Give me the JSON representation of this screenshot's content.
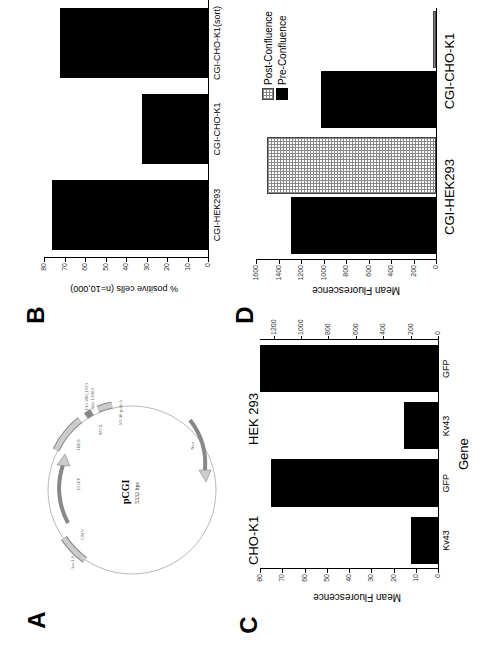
{
  "panels": {
    "A": {
      "label": "A",
      "plasmid_name": "pCGI",
      "plasmid_size": "5332 bps",
      "features": [
        "CMV",
        "EGFP",
        "IRES",
        "MCS",
        "SV40 polyA",
        "Neo",
        "Ase I,6",
        "Pfo 480,1923",
        "Xba 12003"
      ]
    },
    "B": {
      "label": "B"
    },
    "C": {
      "label": "C"
    },
    "D": {
      "label": "D"
    }
  },
  "chart_data": [
    {
      "panel": "B",
      "type": "bar",
      "categories": [
        "CGI-HEK293",
        "CGI-CHO-K1",
        "CGI-CHO-K1(sort)"
      ],
      "values": [
        76,
        32,
        72
      ],
      "title": "",
      "xlabel": "",
      "ylabel": "% positive cells (n=10,000)",
      "ylim": [
        0,
        80
      ],
      "yticks": [
        "0",
        "10",
        "20",
        "30",
        "40",
        "50",
        "60",
        "70",
        "80"
      ],
      "grid": false
    },
    {
      "panel": "C",
      "type": "bar",
      "groups": [
        {
          "name": "CHO-K1",
          "categories": [
            "Kv43",
            "GFP"
          ],
          "values": [
            12,
            75
          ],
          "ylim": [
            0,
            80
          ],
          "yticks": [
            "0",
            "10",
            "20",
            "30",
            "40",
            "50",
            "60",
            "70",
            "80"
          ]
        },
        {
          "name": "HEK 293",
          "categories": [
            "Kv43",
            "GFP"
          ],
          "values": [
            250,
            1300
          ],
          "ylim": [
            0,
            1300
          ],
          "yticks": [
            "0",
            "200",
            "400",
            "600",
            "800",
            "1000",
            "1200"
          ]
        }
      ],
      "xlabel": "Gene",
      "ylabel": "Mean Fluorescence",
      "grid": false
    },
    {
      "panel": "D",
      "type": "bar",
      "categories": [
        "CGI-HEK293",
        "CGI-CHO-K1"
      ],
      "series": [
        {
          "name": "Pre-Confluence",
          "values": [
            1290,
            1020
          ],
          "color": "#000000"
        },
        {
          "name": "Post-Confluence",
          "values": [
            1500,
            30
          ],
          "color": "hatched"
        }
      ],
      "ylabel": "Mean Fluorescence",
      "ylim": [
        0,
        1600
      ],
      "yticks": [
        "0",
        "200",
        "400",
        "600",
        "800",
        "1000",
        "1200",
        "1400",
        "1600"
      ],
      "legend_position": "upper right",
      "grid": false
    }
  ]
}
